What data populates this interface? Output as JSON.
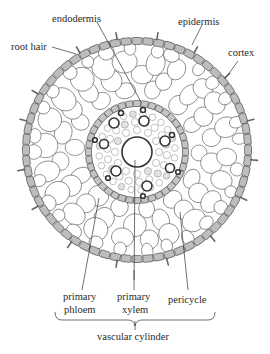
{
  "figure": {
    "colors": {
      "epidermis_fill": "#bdbdbd",
      "endodermis_fill": "#c4c4c4",
      "cell_stroke": "#555555",
      "label_text": "#2a2a2a",
      "background": "#ffffff"
    }
  },
  "labels": {
    "endodermis": "endodermis",
    "epidermis": "epidermis",
    "root_hair": "root hair",
    "cortex": "cortex",
    "primary_phloem_1": "primary",
    "primary_phloem_2": "phloem",
    "primary_xylem_1": "primary",
    "primary_xylem_2": "xylem",
    "pericycle": "pericycle",
    "vascular_cylinder": "vascular cylinder"
  }
}
